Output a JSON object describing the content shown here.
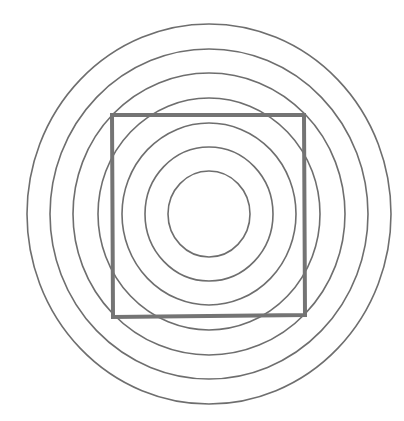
{
  "figure": {
    "width": 404,
    "height": 421,
    "background": "#ffffff",
    "center": {
      "x": 209,
      "y": 214
    },
    "rings": {
      "stroke": "#6e6e6e",
      "stroke_width": 1.6,
      "radii": [
        {
          "rx": 41,
          "ry": 43
        },
        {
          "rx": 64,
          "ry": 67
        },
        {
          "rx": 87,
          "ry": 91
        },
        {
          "rx": 111,
          "ry": 116
        },
        {
          "rx": 136,
          "ry": 141
        },
        {
          "rx": 159,
          "ry": 165
        },
        {
          "rx": 182,
          "ry": 190
        }
      ]
    },
    "square": {
      "points": [
        [
          112,
          115
        ],
        [
          304,
          115
        ],
        [
          305,
          315
        ],
        [
          113,
          317
        ]
      ],
      "stroke": "#747474",
      "stroke_width": 4
    }
  }
}
